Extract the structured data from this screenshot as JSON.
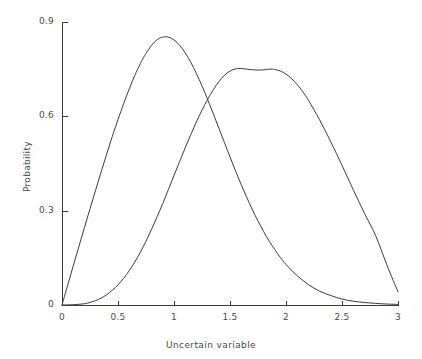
{
  "chart_data": {
    "type": "line",
    "title": "",
    "xlabel": "Uncertain variable",
    "ylabel": "Probability",
    "xlim": [
      0,
      3
    ],
    "ylim": [
      0,
      0.9
    ],
    "grid": false,
    "legend": null,
    "xticks": [
      "0",
      "0.5",
      "1",
      "1.5",
      "2",
      "2.5",
      "3"
    ],
    "xtick_values": [
      0,
      0.5,
      1,
      1.5,
      2,
      2.5,
      3
    ],
    "yticks": [
      "0",
      "0.3",
      "0.6",
      "0.9"
    ],
    "ytick_values": [
      0,
      0.3,
      0.6,
      0.9
    ],
    "line_color": "#3c3c3c",
    "axis_color": "#3c3c3c",
    "annotations": [],
    "series": [
      {
        "name": "distribution-1",
        "color": "#3c3c3c",
        "peak_x": 0.73,
        "peak_y": 0.85,
        "x": [
          0.0,
          0.05,
          0.1,
          0.15,
          0.2,
          0.25,
          0.3,
          0.35,
          0.4,
          0.45,
          0.5,
          0.55,
          0.6,
          0.65,
          0.7,
          0.73,
          0.75,
          0.8,
          0.85,
          0.9,
          0.95,
          1.0,
          1.05,
          1.1,
          1.15,
          1.2,
          1.25,
          1.3,
          1.35,
          1.4,
          1.45,
          1.5,
          1.55,
          1.6,
          1.65,
          1.7,
          1.75,
          1.8,
          1.85,
          1.9,
          1.95,
          2.0,
          2.1,
          2.2,
          2.3,
          2.4,
          2.5,
          2.6,
          2.7,
          2.8,
          2.9,
          3.0
        ],
        "y": [
          0.0,
          0.062,
          0.124,
          0.185,
          0.246,
          0.306,
          0.365,
          0.424,
          0.481,
          0.537,
          0.59,
          0.64,
          0.687,
          0.73,
          0.768,
          0.788,
          0.8,
          0.826,
          0.844,
          0.852,
          0.852,
          0.843,
          0.826,
          0.802,
          0.772,
          0.736,
          0.697,
          0.654,
          0.609,
          0.563,
          0.517,
          0.471,
          0.426,
          0.383,
          0.342,
          0.303,
          0.267,
          0.234,
          0.203,
          0.176,
          0.151,
          0.129,
          0.093,
          0.065,
          0.044,
          0.03,
          0.019,
          0.012,
          0.008,
          0.005,
          0.003,
          0.002
        ]
      },
      {
        "name": "distribution-2",
        "color": "#3c3c3c",
        "peak_x": 1.88,
        "peak_y": 0.75,
        "x": [
          0.0,
          0.1,
          0.2,
          0.25,
          0.3,
          0.35,
          0.4,
          0.45,
          0.5,
          0.55,
          0.6,
          0.65,
          0.7,
          0.75,
          0.8,
          0.85,
          0.9,
          0.95,
          1.0,
          1.05,
          1.1,
          1.15,
          1.2,
          1.25,
          1.3,
          1.35,
          1.4,
          1.45,
          1.5,
          1.55,
          1.6,
          1.65,
          1.7,
          1.75,
          1.8,
          1.85,
          1.88,
          1.9,
          1.95,
          2.0,
          2.05,
          2.1,
          2.15,
          2.2,
          2.3,
          2.4,
          2.5,
          2.6,
          2.7,
          2.8,
          2.9,
          3.0
        ],
        "y": [
          0.0,
          0.001,
          0.004,
          0.008,
          0.014,
          0.022,
          0.033,
          0.047,
          0.064,
          0.085,
          0.109,
          0.137,
          0.168,
          0.203,
          0.241,
          0.281,
          0.323,
          0.367,
          0.412,
          0.456,
          0.5,
          0.542,
          0.582,
          0.62,
          0.654,
          0.684,
          0.71,
          0.73,
          0.744,
          0.751,
          0.752,
          0.75,
          0.748,
          0.747,
          0.748,
          0.75,
          0.75,
          0.749,
          0.744,
          0.734,
          0.72,
          0.701,
          0.678,
          0.651,
          0.589,
          0.519,
          0.444,
          0.367,
          0.292,
          0.221,
          0.128,
          0.042
        ]
      }
    ]
  },
  "axes": {
    "x_tick_labels": [
      {
        "text": "0",
        "value": 0
      },
      {
        "text": "0.5",
        "value": 0.5
      },
      {
        "text": "1",
        "value": 1
      },
      {
        "text": "1.5",
        "value": 1.5
      },
      {
        "text": "2",
        "value": 2
      },
      {
        "text": "2.5",
        "value": 2.5
      },
      {
        "text": "3",
        "value": 3
      }
    ],
    "y_tick_labels": [
      {
        "text": "0",
        "value": 0
      },
      {
        "text": "0.3",
        "value": 0.3
      },
      {
        "text": "0.6",
        "value": 0.6
      },
      {
        "text": "0.9",
        "value": 0.9
      }
    ],
    "x_axis_title": "Uncertain variable",
    "y_axis_title": "Probability"
  }
}
